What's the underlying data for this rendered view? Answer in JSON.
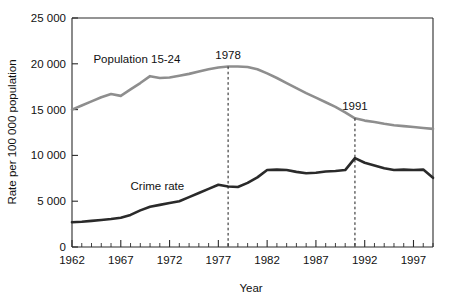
{
  "chart_data": {
    "type": "line",
    "title": "",
    "xlabel": "Year",
    "ylabel": "Rate per 100 000 population",
    "xlim": [
      1962,
      1999
    ],
    "ylim": [
      0,
      25000
    ],
    "grid": false,
    "legend": "inline-labels",
    "x_ticks_major": [
      "1962",
      "1967",
      "1972",
      "1977",
      "1982",
      "1987",
      "1992",
      "1997"
    ],
    "x_ticks_major_values": [
      1962,
      1967,
      1972,
      1977,
      1982,
      1987,
      1992,
      1997
    ],
    "y_ticks": [
      "0",
      "5 000",
      "10 000",
      "15 000",
      "20 000",
      "25 000"
    ],
    "y_tick_values": [
      0,
      5000,
      10000,
      15000,
      20000,
      25000
    ],
    "x": [
      1962,
      1963,
      1964,
      1965,
      1966,
      1967,
      1968,
      1969,
      1970,
      1971,
      1972,
      1973,
      1974,
      1975,
      1976,
      1977,
      1978,
      1979,
      1980,
      1981,
      1982,
      1983,
      1984,
      1985,
      1986,
      1987,
      1988,
      1989,
      1990,
      1991,
      1992,
      1993,
      1994,
      1995,
      1996,
      1997,
      1998,
      1999
    ],
    "series": [
      {
        "name": "Population 15-24",
        "color": "#8e8e8e",
        "values": [
          15000,
          15450,
          15900,
          16350,
          16700,
          16500,
          17200,
          17900,
          18650,
          18450,
          18500,
          18700,
          18900,
          19150,
          19400,
          19600,
          19700,
          19700,
          19650,
          19400,
          18950,
          18450,
          17900,
          17350,
          16800,
          16300,
          15800,
          15300,
          14700,
          14050,
          13800,
          13650,
          13450,
          13300,
          13200,
          13100,
          13000,
          12900
        ]
      },
      {
        "name": "Crime rate",
        "color": "#2a2a2a",
        "values": [
          2700,
          2750,
          2850,
          2950,
          3050,
          3200,
          3500,
          4000,
          4400,
          4600,
          4800,
          5000,
          5450,
          5900,
          6350,
          6800,
          6600,
          6550,
          7000,
          7600,
          8400,
          8450,
          8400,
          8200,
          8050,
          8100,
          8250,
          8300,
          8400,
          9700,
          9200,
          8900,
          8600,
          8400,
          8450,
          8400,
          8450,
          7550
        ]
      }
    ],
    "annotations": [
      {
        "label": "1978",
        "x": 1978,
        "line": "dashed-vertical",
        "from_y": 19700,
        "to_y": 0
      },
      {
        "label": "1991",
        "x": 1991,
        "line": "dashed-vertical",
        "from_y": 14050,
        "to_y": 0
      }
    ],
    "inline_labels": [
      {
        "text": "Population 15-24",
        "x": 1964.2,
        "y": 20100
      },
      {
        "text": "Crime rate",
        "x": 1968.0,
        "y": 6200
      }
    ]
  }
}
